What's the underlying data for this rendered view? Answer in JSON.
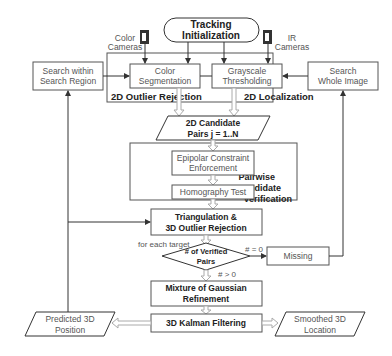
{
  "diagram": {
    "nodes": {
      "tracking_init": {
        "line1": "Tracking",
        "line2": "Initialization"
      },
      "color_cameras": {
        "line1": "Color",
        "line2": "Cameras"
      },
      "ir_cameras": {
        "line1": "IR",
        "line2": "Cameras"
      },
      "search_region": {
        "line1": "Search within",
        "line2": "Search Region"
      },
      "color_seg": {
        "line1": "Color",
        "line2": "Segmentation"
      },
      "grayscale": {
        "line1": "Grayscale",
        "line2": "Thresholding"
      },
      "search_whole": {
        "line1": "Search",
        "line2": "Whole Image"
      },
      "candidate_pairs": {
        "line1": "2D Candidate",
        "line2": "Pairs j = 1..N"
      },
      "epipolar": {
        "line1": "Epipolar Constraint",
        "line2": "Enforcement"
      },
      "homography": {
        "line1": "Homography Test"
      },
      "triangulation": {
        "line1": "Triangulation &",
        "line2": "3D Outlier Rejection"
      },
      "verified_pairs": {
        "line1": "# of Verified",
        "line2": "Pairs"
      },
      "missing": {
        "line1": "Missing"
      },
      "mog": {
        "line1": "Mixture of Gaussian",
        "line2": "Refinement"
      },
      "kalman": {
        "line1": "3D Kalman Filtering"
      },
      "predicted": {
        "line1": "Predicted 3D",
        "line2": "Position"
      },
      "smoothed": {
        "line1": "Smoothed 3D",
        "line2": "Location"
      }
    },
    "groups": {
      "outlier_rejection": "2D Outlier Rejection",
      "localization": "2D Localization",
      "pairwise": {
        "line1": "Pairwise",
        "line2": "Candidate",
        "line3": "Verification"
      }
    },
    "edge_labels": {
      "for_each": "for each target",
      "zero": "# = 0",
      "positive": "# > 0"
    }
  }
}
